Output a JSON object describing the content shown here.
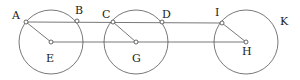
{
  "diagram": {
    "circles": [
      {
        "center": "E",
        "cx": 51,
        "cy": 42,
        "r": 32
      },
      {
        "center": "G",
        "cx": 136,
        "cy": 42,
        "r": 32
      },
      {
        "center": "H",
        "cx": 246,
        "cy": 42,
        "r": 32
      }
    ],
    "points": {
      "A": {
        "label": "A",
        "x": 26,
        "y": 22
      },
      "B": {
        "label": "B",
        "x": 77,
        "y": 21
      },
      "C": {
        "label": "C",
        "x": 113,
        "y": 22
      },
      "D": {
        "label": "D",
        "x": 162,
        "y": 22
      },
      "I": {
        "label": "I",
        "x": 222,
        "y": 23
      },
      "E": {
        "label": "E",
        "x": 51,
        "y": 42
      },
      "G": {
        "label": "G",
        "x": 136,
        "y": 42
      },
      "H": {
        "label": "H",
        "x": 246,
        "y": 42
      },
      "K": {
        "label": "K"
      }
    },
    "segments": [
      [
        "A",
        "I"
      ],
      [
        "E",
        "H"
      ],
      [
        "A",
        "E"
      ],
      [
        "C",
        "G"
      ],
      [
        "I",
        "H"
      ]
    ]
  }
}
